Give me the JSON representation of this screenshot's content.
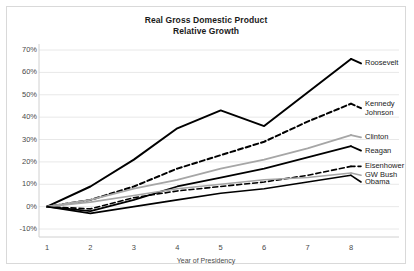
{
  "chart_data": {
    "type": "line",
    "title": "Real Gross Domestic Product",
    "subtitle": "Relative Growth",
    "xlabel": "Year of Presidency",
    "ylabel": "",
    "x": [
      1,
      2,
      3,
      4,
      5,
      6,
      7,
      8
    ],
    "categories": [
      "1",
      "2",
      "3",
      "4",
      "5",
      "6",
      "7",
      "8"
    ],
    "xtick_labels": [
      "1",
      "2",
      "3",
      "4",
      "5",
      "6",
      "7",
      "8"
    ],
    "ytick_labels": [
      "-10%",
      "0%",
      "10%",
      "20%",
      "30%",
      "40%",
      "50%",
      "60%",
      "70%"
    ],
    "ytick_values": [
      -10,
      0,
      10,
      20,
      30,
      40,
      50,
      60,
      70
    ],
    "ylim": [
      -10,
      70
    ],
    "xlim": [
      1,
      8
    ],
    "grid": "horizontal",
    "legend_position": "right-inline",
    "series": [
      {
        "name": "Roosevelt",
        "label": "Roosevelt",
        "style": "solid",
        "color": "#000000",
        "width": 2.0,
        "label_y_pct": 64,
        "values": [
          0,
          9,
          21,
          35,
          43,
          36,
          51,
          66
        ]
      },
      {
        "name": "Kennedy Johnson",
        "label": "Kennedy\nJohnson",
        "style": "dashed",
        "color": "#000000",
        "width": 2.0,
        "label_y_pct": 44,
        "values": [
          0,
          3,
          9,
          17,
          23,
          29,
          38,
          46
        ]
      },
      {
        "name": "Clinton",
        "label": "Clinton",
        "style": "solid",
        "color": "#a6a6a6",
        "width": 1.8,
        "label_y_pct": 31,
        "values": [
          0,
          3,
          8,
          12,
          17,
          21,
          26,
          32
        ]
      },
      {
        "name": "Reagan",
        "label": "Reagan",
        "style": "solid",
        "color": "#000000",
        "width": 1.8,
        "label_y_pct": 25,
        "values": [
          0,
          -2,
          3,
          9,
          13,
          17,
          22,
          27
        ]
      },
      {
        "name": "Eisenhower",
        "label": "Eisenhower",
        "style": "dashed",
        "color": "#000000",
        "width": 1.6,
        "label_y_pct": 18,
        "values": [
          0,
          -1,
          4,
          7,
          9,
          11,
          14,
          18
        ]
      },
      {
        "name": "GW Bush",
        "label": "GW Bush",
        "style": "solid",
        "color": "#a6a6a6",
        "width": 1.6,
        "label_y_pct": 14,
        "values": [
          0,
          2,
          5,
          8,
          10,
          12,
          13,
          15
        ]
      },
      {
        "name": "Obama",
        "label": "Obama",
        "style": "solid",
        "color": "#000000",
        "width": 1.6,
        "label_y_pct": 11,
        "values": [
          0,
          -3,
          0,
          3,
          6,
          8,
          11,
          14
        ]
      }
    ]
  },
  "labels": {
    "roosevelt": "Roosevelt",
    "kennedy": "Kennedy",
    "johnson": "Johnson",
    "clinton": "Clinton",
    "reagan": "Reagan",
    "eisenhower": "Eisenhower",
    "gwbush": "GW Bush",
    "obama": "Obama"
  },
  "colors": {
    "line_dark": "#000000",
    "line_gray": "#a6a6a6",
    "grid": "#e8e8e8",
    "border": "#d9d9d9",
    "text": "#4a4a4a"
  }
}
